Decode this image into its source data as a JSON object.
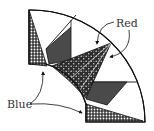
{
  "diagram": {
    "type": "quilt-fan-block",
    "labels": {
      "red": "Red",
      "blue": "Blue"
    },
    "colors": {
      "outline": "#111111",
      "dark_piece": "#4a4a4a",
      "pattern_bg": "#2a2a2a",
      "pattern_dot": "#ffffff",
      "background": "#ffffff"
    },
    "pieces": [
      {
        "id": "blue-top",
        "fabric": "Blue",
        "style": "dotted"
      },
      {
        "id": "dark-top",
        "fabric": "dark",
        "style": "solid"
      },
      {
        "id": "red-spike",
        "fabric": "Red",
        "style": "patterned"
      },
      {
        "id": "dark-bottom",
        "fabric": "dark",
        "style": "solid"
      },
      {
        "id": "blue-bottom",
        "fabric": "Blue",
        "style": "dotted"
      }
    ]
  }
}
